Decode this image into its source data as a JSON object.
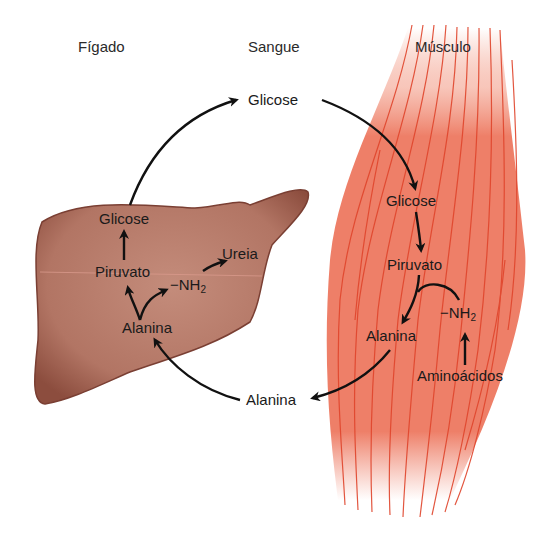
{
  "headers": {
    "liver": "Fígado",
    "blood": "Sangue",
    "muscle": "Músculo"
  },
  "blood": {
    "glucose": "Glicose",
    "alanine": "Alanina"
  },
  "liver": {
    "glucose": "Glicose",
    "pyruvate": "Piruvato",
    "urea": "Ureia",
    "amino_group": "−NH",
    "amino_group_sub": "2",
    "alanine": "Alanina"
  },
  "muscle": {
    "glucose": "Glicose",
    "pyruvate": "Piruvato",
    "amino_group": "−NH",
    "amino_group_sub": "2",
    "alanine": "Alanina",
    "amino_acids": "Aminoácidos"
  },
  "colors": {
    "liver_fill": "#b57a6a",
    "liver_edge": "#7a3f33",
    "muscle_fill": "#ee7f68",
    "muscle_fiber": "#e0452c",
    "arrow": "#111111"
  }
}
